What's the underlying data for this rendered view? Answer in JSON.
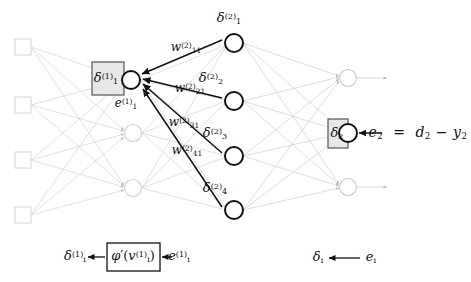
{
  "figure": {
    "background_color": "#ffffff",
    "ink_color": "#111111",
    "faded_color": "#cccccc",
    "box_fill": "#e8e8e8",
    "box_stroke": "#555555"
  },
  "layers": {
    "input": {
      "name": "input-layer",
      "node_shape": "square",
      "count": 4,
      "nodes": [
        {
          "id": "in-1",
          "cx": 23,
          "cy": 47
        },
        {
          "id": "in-2",
          "cx": 23,
          "cy": 105
        },
        {
          "id": "in-3",
          "cx": 23,
          "cy": 160
        },
        {
          "id": "in-4",
          "cx": 23,
          "cy": 215
        }
      ]
    },
    "hidden1": {
      "name": "hidden-layer-1",
      "node_shape": "circle",
      "count": 3,
      "nodes": [
        {
          "id": "h1-1",
          "cx": 131,
          "cy": 80,
          "highlighted": true
        },
        {
          "id": "h1-2",
          "cx": 133,
          "cy": 133,
          "highlighted": false
        },
        {
          "id": "h1-3",
          "cx": 133,
          "cy": 188,
          "highlighted": false
        }
      ]
    },
    "hidden2": {
      "name": "hidden-layer-2",
      "node_shape": "circle",
      "count": 4,
      "nodes": [
        {
          "id": "h2-1",
          "cx": 234,
          "cy": 43,
          "highlighted": true
        },
        {
          "id": "h2-2",
          "cx": 234,
          "cy": 101,
          "highlighted": true
        },
        {
          "id": "h2-3",
          "cx": 234,
          "cy": 156,
          "highlighted": true
        },
        {
          "id": "h2-4",
          "cx": 234,
          "cy": 210,
          "highlighted": true
        }
      ]
    },
    "output": {
      "name": "output-layer",
      "node_shape": "circle",
      "count": 3,
      "nodes": [
        {
          "id": "out-1",
          "cx": 348,
          "cy": 78,
          "highlighted": false
        },
        {
          "id": "out-2",
          "cx": 348,
          "cy": 133,
          "highlighted": true
        },
        {
          "id": "out-3",
          "cx": 348,
          "cy": 187,
          "highlighted": false
        }
      ]
    }
  },
  "labels": {
    "delta_1_1": {
      "text": "δ",
      "sub": "1",
      "sup": "(1)",
      "x": 105,
      "y": 79
    },
    "error_1_1": {
      "text": "e",
      "sub": "1",
      "sup": "(1)",
      "x": 124,
      "y": 103
    },
    "delta_1_2": {
      "text": "δ",
      "sub": "1",
      "sup": "(2)",
      "x": 229,
      "y": 18
    },
    "delta_2_2": {
      "text": "δ",
      "sub": "2",
      "sup": "(2)",
      "x": 210,
      "y": 78
    },
    "delta_3_2": {
      "text": "δ",
      "sub": "3",
      "sup": "(2)",
      "x": 214,
      "y": 133
    },
    "delta_4_2": {
      "text": "δ",
      "sub": "4",
      "sup": "(2)",
      "x": 214,
      "y": 188
    },
    "delta_2_out": {
      "text": "δ",
      "sub": "2",
      "sup": "",
      "x": 335,
      "y": 133
    },
    "weight_11": {
      "text": "w",
      "sub": "11",
      "sup": "(2)",
      "x": 186,
      "y": 47
    },
    "weight_21": {
      "text": "w",
      "sub": "21",
      "sup": "(2)",
      "x": 190,
      "y": 88
    },
    "weight_31": {
      "text": "w",
      "sub": "31",
      "sup": "(2)",
      "x": 184,
      "y": 122
    },
    "weight_41": {
      "text": "w",
      "sub": "41",
      "sup": "(2)",
      "x": 187,
      "y": 150
    }
  },
  "equation": {
    "name": "output-error-equation",
    "text": "e₂ = d₂ − y₂",
    "parts": [
      {
        "sym": "e",
        "sub": "2"
      },
      {
        "sym": "="
      },
      {
        "sym": "d",
        "sub": "2"
      },
      {
        "sym": "−"
      },
      {
        "sym": "y",
        "sub": "2"
      }
    ],
    "x": 418,
    "y": 133
  },
  "legend_hidden": {
    "name": "hidden-neuron-legend",
    "output_label": {
      "text": "δ",
      "sub": "i",
      "sup": "(1)",
      "x": 75,
      "y": 257
    },
    "box_label": {
      "text": "φ′(v",
      "sub": "i",
      "sup": "(1)",
      "close": ")",
      "x": 133,
      "y": 257
    },
    "input_label": {
      "text": "e",
      "sub": "i",
      "sup": "(1)",
      "x": 177,
      "y": 257
    },
    "box": {
      "x": 107,
      "y": 243,
      "w": 53,
      "h": 28
    }
  },
  "legend_output": {
    "name": "output-neuron-legend",
    "output_label": {
      "text": "δ",
      "sub": "i",
      "sup": "",
      "x": 318,
      "y": 258
    },
    "input_label": {
      "text": "e",
      "sub": "i",
      "sup": "",
      "x": 370,
      "y": 258
    }
  },
  "boxes": {
    "delta_1_1_box": {
      "x": 92,
      "y": 62,
      "w": 32,
      "h": 33
    },
    "delta_2_box": {
      "x": 328,
      "y": 119,
      "w": 20,
      "h": 29
    },
    "phi_box": {
      "x": 107,
      "y": 243,
      "w": 53,
      "h": 28
    }
  }
}
